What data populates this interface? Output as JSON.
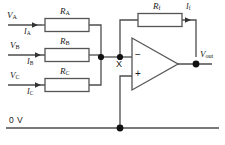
{
  "diagram": {
    "colors": {
      "wire": "#4d4d4d",
      "wire_dark": "#333333",
      "resistor_outline": "#555555",
      "resistor_fill": "#ffffff",
      "node_dot": "#111111",
      "text": "#1a1a1a",
      "background": "#ffffff"
    }
  },
  "inputs": [
    {
      "voltage_label": "V",
      "voltage_sub": "A",
      "current_label": "I",
      "current_sub": "A",
      "resistor_label": "R",
      "resistor_sub": "A"
    },
    {
      "voltage_label": "V",
      "voltage_sub": "B",
      "current_label": "I",
      "current_sub": "B",
      "resistor_label": "R",
      "resistor_sub": "B"
    },
    {
      "voltage_label": "V",
      "voltage_sub": "C",
      "current_label": "I",
      "current_sub": "C",
      "resistor_label": "R",
      "resistor_sub": "C"
    }
  ],
  "feedback": {
    "resistor_label": "R",
    "resistor_sub": "f",
    "current_label": "I",
    "current_sub": "f"
  },
  "opamp": {
    "inverting_input_symbol": "−",
    "noninverting_input_symbol": "+"
  },
  "nodes": {
    "summing_node": "X"
  },
  "output": {
    "label": "V",
    "sub": "out"
  },
  "rail": {
    "label": "0 V"
  }
}
